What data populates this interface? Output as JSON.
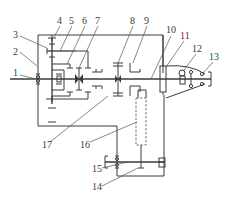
{
  "diagram": {
    "type": "mechanical transmission schematic (kinematic diagram)",
    "colors": {
      "line": "#3a3a3a",
      "background": "#ffffff"
    },
    "labels": [
      {
        "id": "1",
        "text": "1",
        "x": 14,
        "y": 75
      },
      {
        "id": "2",
        "text": "2",
        "x": 13,
        "y": 54
      },
      {
        "id": "3",
        "text": "3",
        "x": 14,
        "y": 38
      },
      {
        "id": "4",
        "text": "4",
        "x": 57,
        "y": 24
      },
      {
        "id": "5",
        "text": "5",
        "x": 70,
        "y": 24
      },
      {
        "id": "6",
        "text": "6",
        "x": 82,
        "y": 24
      },
      {
        "id": "7",
        "text": "7",
        "x": 95,
        "y": 24
      },
      {
        "id": "8",
        "text": "8",
        "x": 130,
        "y": 24
      },
      {
        "id": "9",
        "text": "9",
        "x": 144,
        "y": 24
      },
      {
        "id": "10",
        "text": "10",
        "x": 168,
        "y": 34
      },
      {
        "id": "11",
        "text": "11",
        "x": 181,
        "y": 39
      },
      {
        "id": "12",
        "text": "12",
        "x": 193,
        "y": 52
      },
      {
        "id": "13",
        "text": "13",
        "x": 210,
        "y": 60
      },
      {
        "id": "14",
        "text": "14",
        "x": 94,
        "y": 188
      },
      {
        "id": "15",
        "text": "15",
        "x": 94,
        "y": 171
      },
      {
        "id": "16",
        "text": "16",
        "x": 82,
        "y": 147
      },
      {
        "id": "17",
        "text": "17",
        "x": 44,
        "y": 147
      }
    ]
  }
}
